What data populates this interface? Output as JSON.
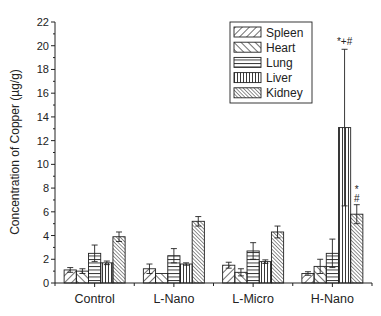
{
  "chart_data": {
    "type": "bar",
    "title": "",
    "xlabel": "",
    "ylabel": "Concentration of Copper (µg/g)",
    "ylim": [
      0,
      22
    ],
    "yticks": [
      0,
      2,
      4,
      6,
      8,
      10,
      12,
      14,
      16,
      18,
      20,
      22
    ],
    "grid": false,
    "legend_position": "upper right (inside)",
    "categories": [
      "Control",
      "L-Nano",
      "L-Micro",
      "H-Nano"
    ],
    "series": [
      {
        "name": "Spleen",
        "pattern": "diag-fwd",
        "values": [
          1.1,
          1.2,
          1.5,
          0.8
        ],
        "errors": [
          0.2,
          0.4,
          0.25,
          0.15
        ]
      },
      {
        "name": "Heart",
        "pattern": "diag-back",
        "values": [
          1.0,
          0.8,
          0.9,
          1.4
        ],
        "errors": [
          0.2,
          0.0,
          0.3,
          0.6
        ]
      },
      {
        "name": "Lung",
        "pattern": "horizontal",
        "values": [
          2.5,
          2.3,
          2.7,
          2.5
        ],
        "errors": [
          0.7,
          0.6,
          0.7,
          1.2
        ]
      },
      {
        "name": "Liver",
        "pattern": "vertical",
        "values": [
          1.7,
          1.6,
          1.8,
          13.1
        ],
        "errors": [
          0.15,
          0.1,
          0.15,
          6.6
        ]
      },
      {
        "name": "Kidney",
        "pattern": "dense-diag-back",
        "values": [
          3.9,
          5.2,
          4.3,
          5.8
        ],
        "errors": [
          0.4,
          0.4,
          0.5,
          0.8
        ]
      }
    ],
    "annotations": [
      {
        "category": "H-Nano",
        "series": "Liver",
        "text": "*+#"
      },
      {
        "category": "H-Nano",
        "series": "Kidney",
        "text_lines": [
          "*",
          "#"
        ]
      }
    ]
  },
  "colors": {
    "ink": "#222222",
    "background": "#ffffff"
  }
}
